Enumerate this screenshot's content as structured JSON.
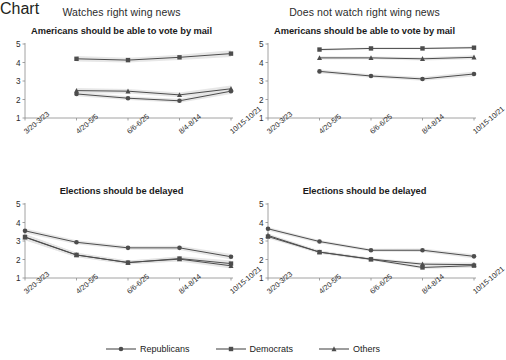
{
  "figure": {
    "background": "#ffffff",
    "line_color": "#4d4d4d",
    "band_color": "#e3e3e3",
    "axis_color": "#8c8c8c"
  },
  "column_headers": [
    {
      "label": "Watches right wing news"
    },
    {
      "label": "Does not watch right wing news"
    }
  ],
  "legend": {
    "items": [
      {
        "label": "Republicans",
        "marker": "circle"
      },
      {
        "label": "Democrats",
        "marker": "square"
      },
      {
        "label": "Others",
        "marker": "triangle"
      }
    ]
  },
  "chart_data": [
    {
      "id": "vote-by-mail-watches",
      "type": "line",
      "title": "Americans should be able to vote by mail",
      "column": "Watches right wing news",
      "xlabel": "",
      "ylabel": "",
      "ylim": [
        1,
        5
      ],
      "yticks": [
        1,
        2,
        3,
        4,
        5
      ],
      "grid": false,
      "categories": [
        "3/20-3/23",
        "4/20-5/5",
        "6/6-6/25",
        "8/4-8/14",
        "10/15-10/21"
      ],
      "series": [
        {
          "name": "Republicans",
          "marker": "circle",
          "values": [
            null,
            2.3,
            2.07,
            1.93,
            2.45
          ],
          "ci_low": [
            null,
            2.18,
            1.97,
            1.82,
            2.3
          ],
          "ci_high": [
            null,
            2.42,
            2.17,
            2.04,
            2.6
          ]
        },
        {
          "name": "Democrats",
          "marker": "square",
          "values": [
            null,
            4.2,
            4.13,
            4.28,
            4.48
          ],
          "ci_low": [
            null,
            4.05,
            4.0,
            4.14,
            4.3
          ],
          "ci_high": [
            null,
            4.35,
            4.26,
            4.42,
            4.66
          ]
        },
        {
          "name": "Others",
          "marker": "triangle",
          "values": [
            null,
            2.48,
            2.45,
            2.25,
            2.58
          ],
          "ci_low": [
            null,
            2.34,
            2.33,
            2.12,
            2.4
          ],
          "ci_high": [
            null,
            2.62,
            2.57,
            2.38,
            2.76
          ]
        }
      ]
    },
    {
      "id": "vote-by-mail-does-not-watch",
      "type": "line",
      "title": "Americans should be able to vote by mail",
      "column": "Does not watch right wing news",
      "xlabel": "",
      "ylabel": "",
      "ylim": [
        1,
        5
      ],
      "yticks": [
        1,
        2,
        3,
        4,
        5
      ],
      "grid": false,
      "categories": [
        "3/20-3/23",
        "4/20-5/5",
        "6/6-6/25",
        "8/4-8/14",
        "10/15-10/21"
      ],
      "series": [
        {
          "name": "Republicans",
          "marker": "circle",
          "values": [
            null,
            3.52,
            3.27,
            3.11,
            3.38
          ],
          "ci_low": [
            null,
            3.42,
            3.18,
            3.01,
            3.25
          ],
          "ci_high": [
            null,
            3.62,
            3.36,
            3.21,
            3.51
          ]
        },
        {
          "name": "Democrats",
          "marker": "square",
          "values": [
            null,
            4.7,
            4.76,
            4.76,
            4.8
          ],
          "ci_low": [
            null,
            4.64,
            4.71,
            4.71,
            4.74
          ],
          "ci_high": [
            null,
            4.76,
            4.81,
            4.81,
            4.86
          ]
        },
        {
          "name": "Others",
          "marker": "triangle",
          "values": [
            null,
            4.25,
            4.25,
            4.2,
            4.28
          ],
          "ci_low": [
            null,
            4.16,
            4.17,
            4.11,
            4.17
          ],
          "ci_high": [
            null,
            4.34,
            4.33,
            4.29,
            4.39
          ]
        }
      ]
    },
    {
      "id": "elections-delayed-watches",
      "type": "line",
      "title": "Elections should be delayed",
      "column": "Watches right wing news",
      "xlabel": "",
      "ylabel": "",
      "ylim": [
        1,
        5
      ],
      "yticks": [
        1,
        2,
        3,
        4,
        5
      ],
      "grid": false,
      "categories": [
        "3/20-3/23",
        "4/20-5/5",
        "6/6-6/25",
        "8/4-8/14",
        "10/15-10/21"
      ],
      "series": [
        {
          "name": "Republicans",
          "marker": "circle",
          "values": [
            3.55,
            2.93,
            2.63,
            2.63,
            2.15
          ],
          "ci_low": [
            3.42,
            2.82,
            2.53,
            2.52,
            2.0
          ],
          "ci_high": [
            3.68,
            3.04,
            2.73,
            2.74,
            2.3
          ]
        },
        {
          "name": "Democrats",
          "marker": "square",
          "values": [
            3.22,
            2.25,
            1.83,
            2.05,
            1.78
          ],
          "ci_low": [
            3.06,
            2.13,
            1.73,
            1.92,
            1.62
          ],
          "ci_high": [
            3.38,
            2.37,
            1.93,
            2.18,
            1.94
          ]
        },
        {
          "name": "Others",
          "marker": "triangle",
          "values": [
            3.2,
            2.24,
            1.84,
            2.02,
            1.66
          ],
          "ci_low": [
            3.04,
            2.12,
            1.74,
            1.89,
            1.52
          ],
          "ci_high": [
            3.36,
            2.36,
            1.94,
            2.15,
            1.8
          ]
        }
      ]
    },
    {
      "id": "elections-delayed-does-not-watch",
      "type": "line",
      "title": "Elections should be delayed",
      "column": "Does not watch right wing news",
      "xlabel": "",
      "ylabel": "",
      "ylim": [
        1,
        5
      ],
      "yticks": [
        1,
        2,
        3,
        4,
        5
      ],
      "grid": false,
      "categories": [
        "3/20-3/23",
        "4/20-5/5",
        "6/6-6/25",
        "8/4-8/14",
        "10/15-10/21"
      ],
      "series": [
        {
          "name": "Republicans",
          "marker": "circle",
          "values": [
            3.66,
            2.97,
            2.5,
            2.5,
            2.17
          ],
          "ci_low": [
            3.56,
            2.88,
            2.42,
            2.41,
            2.05
          ],
          "ci_high": [
            3.76,
            3.06,
            2.58,
            2.59,
            2.29
          ]
        },
        {
          "name": "Democrats",
          "marker": "square",
          "values": [
            3.24,
            2.4,
            2.01,
            1.57,
            1.67
          ],
          "ci_low": [
            3.14,
            2.32,
            1.94,
            1.49,
            1.56
          ],
          "ci_high": [
            3.34,
            2.48,
            2.08,
            1.65,
            1.78
          ]
        },
        {
          "name": "Others",
          "marker": "triangle",
          "values": [
            3.3,
            2.4,
            2.02,
            1.75,
            1.72
          ],
          "ci_low": [
            3.19,
            2.31,
            1.94,
            1.66,
            1.6
          ],
          "ci_high": [
            3.41,
            2.49,
            2.1,
            1.84,
            1.84
          ]
        }
      ]
    }
  ]
}
